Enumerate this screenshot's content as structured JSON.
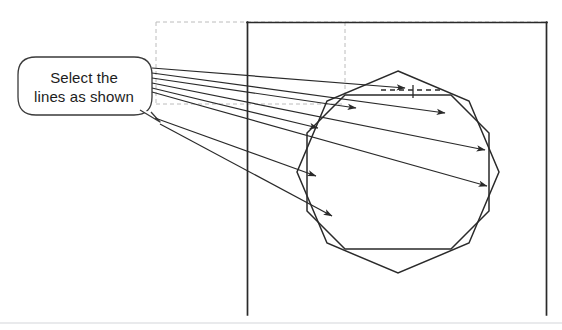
{
  "figure": {
    "background_color": "#ffffff",
    "line_color": "#2a2a2a",
    "dashed_color": "#b8b8b8",
    "text_color": "#1d1d1d",
    "width": 562,
    "height": 330
  },
  "callout": {
    "line1": "Select the",
    "line2": "lines as shown",
    "shape": "rounded-rectangle-with-tail",
    "x": 18,
    "y": 57,
    "width": 132,
    "height": 58,
    "corner_radius": 18,
    "border_color": "#3a3a3a",
    "fill_color": "#ffffff"
  },
  "leader_lines": {
    "count": 7,
    "origin_x": 152,
    "origin_y_start": 68,
    "origin_y_end": 92,
    "description": "fan of pointer lines from callout to polygon edges",
    "arrowheads": 7
  },
  "drawing_frame": {
    "left_edge_x": 247,
    "right_edge_x": 547,
    "top_edge_y": 22,
    "bottom_edge_y": 315,
    "color": "#2a2a2a",
    "stroke_width": 1.6
  },
  "dashed_guides": {
    "rect_left_x": 156,
    "rect_right_x": 345,
    "rect_top_y": 22,
    "rect_bottom_y": 104,
    "vertical_extra_x": 345,
    "vertical_extra_bottom_y": 95,
    "color": "#bcbcbc",
    "dash_pattern": "4 3"
  },
  "shapes": {
    "octagon_axis_aligned": {
      "name": "outer-octagon",
      "center_x": 398,
      "center_y": 172,
      "radius": 99,
      "rotation_deg": 22.5,
      "sides": 8
    },
    "octagon_rotated": {
      "name": "inner-octagon",
      "center_x": 398,
      "center_y": 172,
      "radius": 101,
      "rotation_deg": 0,
      "sides": 8
    }
  },
  "marker": {
    "name": "dimension-tick",
    "x": 413,
    "y": 92,
    "dashed_segment_from_x": 383,
    "dashed_segment_to_x": 440
  }
}
